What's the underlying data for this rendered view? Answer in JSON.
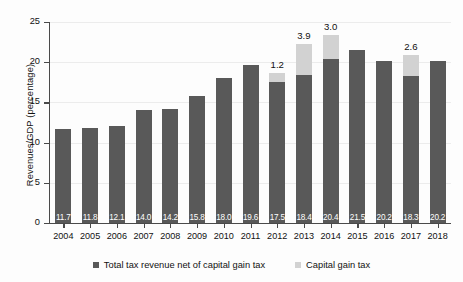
{
  "chart_data": {
    "type": "bar",
    "stacked": true,
    "title": "",
    "xlabel": "",
    "ylabel": "Revenues/GDP (percentage)",
    "categories": [
      "2004",
      "2005",
      "2006",
      "2007",
      "2008",
      "2009",
      "2010",
      "2011",
      "2012",
      "2013",
      "2014",
      "2015",
      "2016",
      "2017",
      "2018"
    ],
    "series": [
      {
        "name": "Total tax revenue net of capital gain tax",
        "color": "#595959",
        "values": [
          11.7,
          11.8,
          12.1,
          14.0,
          14.2,
          15.8,
          18.0,
          19.6,
          17.5,
          18.4,
          20.4,
          21.5,
          20.2,
          18.3,
          20.2
        ],
        "data_labels": [
          "11.7",
          "11.8",
          "12.1",
          "14.0",
          "14.2",
          "15.8",
          "18.0",
          "19.6",
          "17.5",
          "18.4",
          "20.4",
          "21.5",
          "20.2",
          "18.3",
          "20.2"
        ]
      },
      {
        "name": "Capital gain tax",
        "color": "#d2d2d2",
        "values": [
          0,
          0,
          0,
          0,
          0,
          0,
          0,
          0,
          1.2,
          3.9,
          3.0,
          0,
          0,
          2.6,
          0
        ],
        "data_labels": [
          "",
          "",
          "",
          "",
          "",
          "",
          "",
          "",
          "1.2",
          "3.9",
          "3.0",
          "",
          "",
          "2.6",
          ""
        ]
      }
    ],
    "ylim": [
      0,
      25
    ],
    "yticks": [
      0,
      5,
      10,
      15,
      20,
      25
    ],
    "ytick_labels": [
      "0",
      "5",
      "10",
      "15",
      "20",
      "25"
    ],
    "grid": true,
    "legend_position": "bottom"
  },
  "legend": {
    "items": [
      {
        "label": "Total tax revenue net of capital gain tax",
        "color": "#595959"
      },
      {
        "label": "Capital gain tax",
        "color": "#d2d2d2"
      }
    ]
  }
}
